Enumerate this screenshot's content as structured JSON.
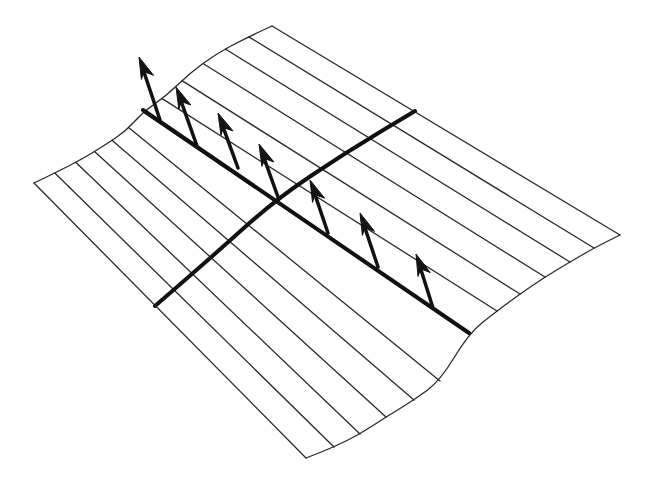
{
  "figure": {
    "title": "",
    "colors": {
      "background": "#ffffff",
      "line": "#2a2a2a",
      "emphasis": "#111111"
    },
    "surface": {
      "back_edge": [
        [
          34,
          183
        ],
        [
          59,
          171
        ],
        [
          84,
          158
        ],
        [
          105,
          145
        ],
        [
          126,
          131
        ],
        [
          143,
          112
        ],
        [
          166,
          96
        ],
        [
          190,
          73
        ],
        [
          216,
          54
        ],
        [
          244,
          39
        ],
        [
          272,
          26
        ]
      ],
      "front_edge": [
        [
          306,
          458
        ],
        [
          334,
          447
        ],
        [
          360,
          434
        ],
        [
          386,
          417
        ],
        [
          414,
          400
        ],
        [
          440,
          381
        ],
        [
          469,
          333
        ],
        [
          497,
          311
        ],
        [
          520,
          294
        ],
        [
          545,
          277
        ],
        [
          570,
          262
        ],
        [
          594,
          248
        ],
        [
          620,
          235
        ]
      ]
    },
    "rulings_count": 11,
    "thick_ruling": {
      "from": [
        143,
        110
      ],
      "to": [
        469,
        333
      ]
    },
    "transverse_curve": {
      "points": [
        [
          155,
          306
        ],
        [
          215,
          254
        ],
        [
          275,
          200
        ],
        [
          345,
          153
        ],
        [
          415,
          111
        ]
      ]
    },
    "normal_vectors": [
      {
        "base": [
          160,
          120
        ],
        "tip": [
          139,
          57
        ]
      },
      {
        "base": [
          197,
          146
        ],
        "tip": [
          176,
          87
        ]
      },
      {
        "base": [
          238,
          168
        ],
        "tip": [
          218,
          113
        ]
      },
      {
        "base": [
          278,
          197
        ],
        "tip": [
          259,
          144
        ]
      },
      {
        "base": [
          328,
          233
        ],
        "tip": [
          310,
          180
        ]
      },
      {
        "base": [
          378,
          267
        ],
        "tip": [
          360,
          213
        ]
      },
      {
        "base": [
          433,
          308
        ],
        "tip": [
          416,
          254
        ]
      }
    ]
  }
}
